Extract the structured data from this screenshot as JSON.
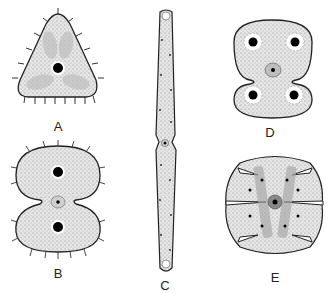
{
  "figure": {
    "panels": [
      {
        "id": "A",
        "label": "A",
        "shape": "triangular cell with spines"
      },
      {
        "id": "B",
        "label": "B",
        "shape": "constricted two-lobed cell with spines"
      },
      {
        "id": "C",
        "label": "C",
        "shape": "elongated rod-shaped cell"
      },
      {
        "id": "D",
        "label": "D",
        "shape": "two-lobed cell with four chloroplast centers"
      },
      {
        "id": "E",
        "label": "E",
        "shape": "incised lobed cell"
      }
    ]
  }
}
